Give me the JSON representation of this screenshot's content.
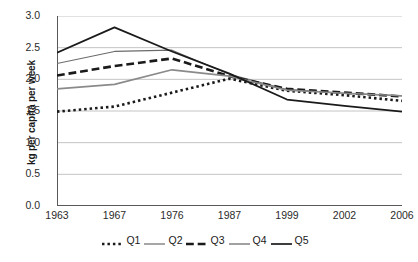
{
  "chart_data": {
    "type": "line",
    "title": "",
    "subtitle": "",
    "xlabel": "",
    "ylabel": "kg per capita per week",
    "x": [
      "1963",
      "1967",
      "1976",
      "1987",
      "1999",
      "2002",
      "2006"
    ],
    "ylim": [
      0.0,
      3.0
    ],
    "yticks": [
      "0.0",
      "0.5",
      "1.0",
      "1.5",
      "2.0",
      "2.5",
      "3.0"
    ],
    "ytick_values": [
      0.0,
      0.5,
      1.0,
      1.5,
      2.0,
      2.5,
      3.0
    ],
    "grid": "horizontal",
    "legend_position": "bottom",
    "series": [
      {
        "name": "Q1",
        "values": [
          1.49,
          1.57,
          1.79,
          2.01,
          1.82,
          1.75,
          1.66
        ],
        "style": "dotted",
        "width": 2.6,
        "color": "#1a1a1a"
      },
      {
        "name": "Q2",
        "values": [
          2.25,
          2.44,
          2.46,
          2.08,
          1.84,
          1.78,
          1.74
        ],
        "style": "solid",
        "width": 1.2,
        "color": "#6b6b6b"
      },
      {
        "name": "Q3",
        "values": [
          2.06,
          2.21,
          2.33,
          2.05,
          1.85,
          1.79,
          1.73
        ],
        "style": "dashed",
        "width": 2.6,
        "color": "#1a1a1a"
      },
      {
        "name": "Q4",
        "values": [
          1.85,
          1.92,
          2.15,
          2.05,
          1.83,
          1.78,
          1.74
        ],
        "style": "solid",
        "width": 1.6,
        "color": "#8a8a8a"
      },
      {
        "name": "Q5",
        "values": [
          2.42,
          2.82,
          2.44,
          2.09,
          1.68,
          1.58,
          1.49
        ],
        "style": "solid",
        "width": 1.7,
        "color": "#1a1a1a"
      }
    ]
  },
  "axis": {
    "grid_color": "#b5b5b5",
    "axis_color": "#595959"
  },
  "legend": {
    "items": [
      {
        "label": "Q1"
      },
      {
        "label": "Q2"
      },
      {
        "label": "Q3"
      },
      {
        "label": "Q4"
      },
      {
        "label": "Q5"
      }
    ]
  }
}
